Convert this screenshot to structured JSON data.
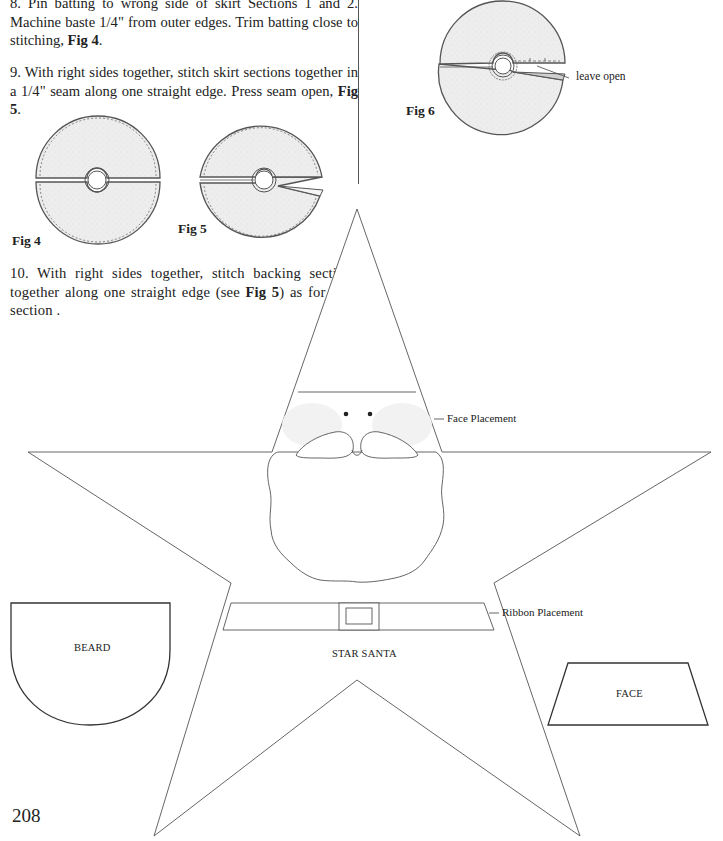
{
  "instructions": [
    {
      "step": "8.",
      "text_before": " Pin batting to wrong side of skirt Sections 1 and 2. Machine baste 1/4\" from outer edges. Trim batting close to stitching, ",
      "fig_ref": "Fig 4",
      "text_after": "."
    },
    {
      "step": "9.",
      "text_before": " With right sides together, stitch skirt sections together in a 1/4\" seam along one straight edge. Press seam open, ",
      "fig_ref": "Fig 5",
      "text_after": "."
    },
    {
      "step": "10.",
      "text_before": " With right sides together, stitch backing sections together along one straight edge (see ",
      "fig_ref": "Fig 5",
      "text_after": ") as for skirt section ."
    }
  ],
  "figures": {
    "fig4": {
      "label": "Fig 4"
    },
    "fig5": {
      "label": "Fig 5"
    },
    "fig6": {
      "label": "Fig 6",
      "callout": "leave open"
    }
  },
  "pattern": {
    "title": "STAR SANTA",
    "face_placement": "Face Placement",
    "ribbon_placement": "Ribbon Placement",
    "beard_label": "BEARD",
    "face_label": "FACE"
  },
  "colors": {
    "line": "#444444",
    "fabric_fill": "#ececec",
    "cheek_fill": "#f0f0f0"
  },
  "page_number": "208"
}
